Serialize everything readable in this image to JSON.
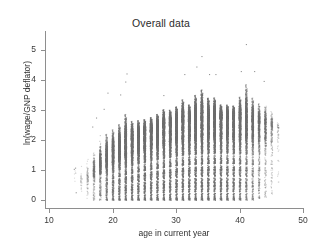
{
  "chart_data": {
    "type": "scatter",
    "title": "Overall data",
    "xlabel": "age in current year",
    "ylabel": "ln(wage/GNP deflator)",
    "xlim": [
      10,
      50
    ],
    "ylim": [
      0,
      5.4
    ],
    "grid": false,
    "legend": null,
    "marker": {
      "shape": "circle",
      "size_px": 1.1,
      "color": "#6f6f6f",
      "opacity": 0.55
    },
    "xticks": [
      10,
      20,
      30,
      40,
      50
    ],
    "xticklabels": [
      "10",
      "20",
      "30",
      "40",
      "50"
    ],
    "yticks": [
      0,
      1,
      2,
      3,
      4,
      5
    ],
    "yticklabels": [
      "0",
      "1",
      "2",
      "3",
      "4",
      "5"
    ],
    "columns": [
      {
        "age": 14,
        "n": 6,
        "median": 1.05,
        "low": 0.25,
        "high": 1.15
      },
      {
        "age": 15,
        "n": 30,
        "median": 0.7,
        "low": 0.05,
        "high": 1.6
      },
      {
        "age": 16,
        "n": 90,
        "median": 0.8,
        "low": 0.0,
        "high": 1.85
      },
      {
        "age": 17,
        "n": 300,
        "median": 1.0,
        "low": 0.0,
        "high": 2.3
      },
      {
        "age": 18,
        "n": 620,
        "median": 1.25,
        "low": 0.0,
        "high": 2.65
      },
      {
        "age": 19,
        "n": 900,
        "median": 1.45,
        "low": 0.0,
        "high": 3.05
      },
      {
        "age": 20,
        "n": 1100,
        "median": 1.6,
        "low": 0.0,
        "high": 3.2
      },
      {
        "age": 21,
        "n": 1250,
        "median": 1.75,
        "low": 0.0,
        "high": 3.4
      },
      {
        "age": 22,
        "n": 1400,
        "median": 1.9,
        "low": 0.0,
        "high": 3.95
      },
      {
        "age": 23,
        "n": 1500,
        "median": 2.0,
        "low": 0.0,
        "high": 3.35
      },
      {
        "age": 24,
        "n": 1600,
        "median": 2.1,
        "low": 0.0,
        "high": 3.3
      },
      {
        "age": 25,
        "n": 1700,
        "median": 2.2,
        "low": 0.0,
        "high": 3.25
      },
      {
        "age": 26,
        "n": 1780,
        "median": 2.28,
        "low": 0.0,
        "high": 3.3
      },
      {
        "age": 27,
        "n": 1840,
        "median": 2.35,
        "low": 0.0,
        "high": 3.45
      },
      {
        "age": 28,
        "n": 1900,
        "median": 2.42,
        "low": 0.0,
        "high": 3.7
      },
      {
        "age": 29,
        "n": 1950,
        "median": 2.48,
        "low": 0.0,
        "high": 3.6
      },
      {
        "age": 30,
        "n": 2000,
        "median": 2.55,
        "low": 0.0,
        "high": 3.75
      },
      {
        "age": 31,
        "n": 2020,
        "median": 2.6,
        "low": 0.0,
        "high": 4.2
      },
      {
        "age": 32,
        "n": 2040,
        "median": 2.63,
        "low": 0.0,
        "high": 3.8
      },
      {
        "age": 33,
        "n": 2050,
        "median": 2.66,
        "low": 0.0,
        "high": 4.45
      },
      {
        "age": 34,
        "n": 2040,
        "median": 2.68,
        "low": 0.0,
        "high": 4.8
      },
      {
        "age": 35,
        "n": 2020,
        "median": 2.7,
        "low": 0.0,
        "high": 4.2
      },
      {
        "age": 36,
        "n": 1980,
        "median": 2.72,
        "low": 0.0,
        "high": 4.2
      },
      {
        "age": 37,
        "n": 1900,
        "median": 2.72,
        "low": 0.0,
        "high": 3.7
      },
      {
        "age": 38,
        "n": 1800,
        "median": 2.72,
        "low": 0.0,
        "high": 3.7
      },
      {
        "age": 39,
        "n": 1650,
        "median": 2.7,
        "low": 0.0,
        "high": 3.65
      },
      {
        "age": 40,
        "n": 1450,
        "median": 2.68,
        "low": 0.0,
        "high": 4.3
      },
      {
        "age": 41,
        "n": 1200,
        "median": 2.66,
        "low": 0.0,
        "high": 5.2
      },
      {
        "age": 42,
        "n": 950,
        "median": 2.62,
        "low": 0.0,
        "high": 4.3
      },
      {
        "age": 43,
        "n": 700,
        "median": 2.58,
        "low": 0.05,
        "high": 3.95
      },
      {
        "age": 44,
        "n": 480,
        "median": 2.52,
        "low": 0.1,
        "high": 4.0
      },
      {
        "age": 45,
        "n": 260,
        "median": 2.45,
        "low": 0.15,
        "high": 3.55
      },
      {
        "age": 46,
        "n": 60,
        "median": 2.4,
        "low": 0.6,
        "high": 2.95
      }
    ],
    "outliers": [
      {
        "age": 41.0,
        "value": 5.2
      },
      {
        "age": 34.0,
        "value": 4.8
      },
      {
        "age": 33.2,
        "value": 4.45
      },
      {
        "age": 22.2,
        "value": 4.22
      },
      {
        "age": 40.2,
        "value": 4.3
      },
      {
        "age": 42.3,
        "value": 4.3
      },
      {
        "age": 31.3,
        "value": 4.2
      },
      {
        "age": 35.2,
        "value": 4.2
      },
      {
        "age": 36.2,
        "value": 4.2
      },
      {
        "age": 22.0,
        "value": 3.95
      },
      {
        "age": 43.8,
        "value": 3.97
      },
      {
        "age": 19.2,
        "value": 3.58
      },
      {
        "age": 21.2,
        "value": 3.52
      },
      {
        "age": 28.0,
        "value": 3.5
      },
      {
        "age": 18.6,
        "value": 3.04
      },
      {
        "age": 17.4,
        "value": 2.75
      },
      {
        "age": 16.8,
        "value": 2.45
      },
      {
        "age": 14.1,
        "value": 1.08
      },
      {
        "age": 13.9,
        "value": 1.04
      },
      {
        "age": 14.2,
        "value": 0.26
      }
    ]
  },
  "title": {
    "text": "Overall data"
  },
  "axes": {
    "x": {
      "label": "age in current year",
      "ticks": [
        "10",
        "20",
        "30",
        "40",
        "50"
      ]
    },
    "y": {
      "label": "ln(wage/GNP deflator)",
      "ticks": [
        "0",
        "1",
        "2",
        "3",
        "4",
        "5"
      ]
    }
  }
}
